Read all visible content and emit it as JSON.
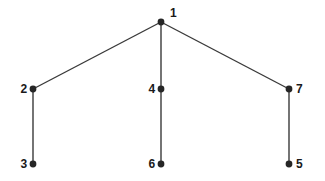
{
  "figure": {
    "title": "",
    "background_color": "#ffffff",
    "width": 325,
    "height": 181
  },
  "style": {
    "node_color": "#262626",
    "edge_color": "#3a3a3a",
    "label_color": "#1a1a1a",
    "node_radius": 3.4,
    "edge_width": 1.4
  },
  "graph": {
    "type": "tree",
    "root": "1",
    "nodes": [
      {
        "id": "n1",
        "label": "1",
        "x": 161,
        "y": 22,
        "label_x": 170,
        "label_y": 13,
        "label_side": "right"
      },
      {
        "id": "n2",
        "label": "2",
        "x": 33,
        "y": 89,
        "label_x": 27,
        "label_y": 89,
        "label_side": "left"
      },
      {
        "id": "n3",
        "label": "3",
        "x": 33,
        "y": 164,
        "label_x": 27,
        "label_y": 164,
        "label_side": "left"
      },
      {
        "id": "n4",
        "label": "4",
        "x": 161,
        "y": 89,
        "label_x": 155,
        "label_y": 89,
        "label_side": "left"
      },
      {
        "id": "n6",
        "label": "6",
        "x": 161,
        "y": 164,
        "label_x": 155,
        "label_y": 164,
        "label_side": "left"
      },
      {
        "id": "n7",
        "label": "7",
        "x": 289,
        "y": 89,
        "label_x": 296,
        "label_y": 89,
        "label_side": "right"
      },
      {
        "id": "n5",
        "label": "5",
        "x": 289,
        "y": 164,
        "label_x": 296,
        "label_y": 164,
        "label_side": "right"
      }
    ],
    "edges": [
      {
        "id": "e1",
        "from": "n1",
        "to": "n2",
        "x1": 161,
        "y1": 22,
        "x2": 33,
        "y2": 89
      },
      {
        "id": "e2",
        "from": "n1",
        "to": "n4",
        "x1": 161,
        "y1": 22,
        "x2": 161,
        "y2": 89
      },
      {
        "id": "e3",
        "from": "n1",
        "to": "n7",
        "x1": 161,
        "y1": 22,
        "x2": 289,
        "y2": 89
      },
      {
        "id": "e4",
        "from": "n2",
        "to": "n3",
        "x1": 33,
        "y1": 89,
        "x2": 33,
        "y2": 164
      },
      {
        "id": "e5",
        "from": "n4",
        "to": "n6",
        "x1": 161,
        "y1": 89,
        "x2": 161,
        "y2": 164
      },
      {
        "id": "e6",
        "from": "n7",
        "to": "n5",
        "x1": 289,
        "y1": 89,
        "x2": 289,
        "y2": 164
      }
    ]
  }
}
